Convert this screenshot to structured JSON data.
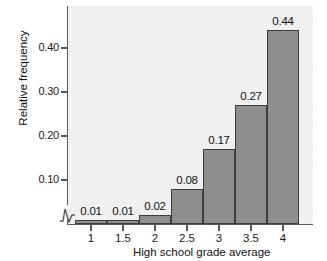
{
  "chart_data": {
    "type": "bar",
    "title": "",
    "xlabel": "High school grade average",
    "ylabel": "Relative frequency",
    "categories": [
      "1",
      "1.5",
      "2",
      "2.5",
      "3",
      "3.5",
      "4"
    ],
    "values": [
      0.01,
      0.01,
      0.02,
      0.08,
      0.17,
      0.27,
      0.44
    ],
    "bar_labels": [
      "0.01",
      "0.01",
      "0.02",
      "0.08",
      "0.17",
      "0.27",
      "0.44"
    ],
    "ytick_labels": [
      "0.10",
      "0.20",
      "0.30",
      "0.40"
    ],
    "ytick_values": [
      0.1,
      0.2,
      0.3,
      0.4
    ],
    "ylim": [
      0,
      0.47
    ],
    "grid": false,
    "legend": "none",
    "axis_break": true,
    "colors": {
      "bar_fill": "#8e8e8e",
      "bar_edge": "#3d3d3d",
      "panel_background": "#f1f1f1",
      "axis": "#58585a",
      "text": "#111111"
    }
  }
}
